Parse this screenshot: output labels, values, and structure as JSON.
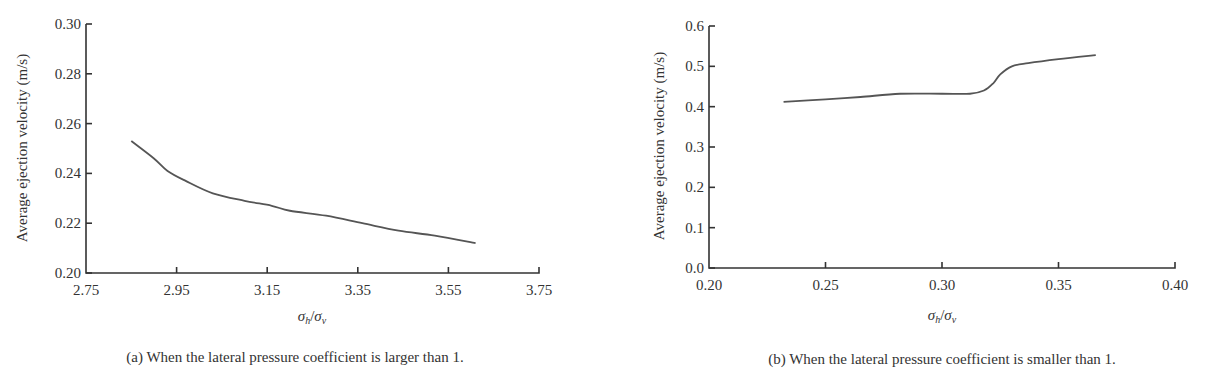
{
  "chart_data": [
    {
      "id": "a",
      "type": "line",
      "title": "",
      "caption": "(a) When the lateral pressure coefficient is larger than 1.",
      "xlabel": "σh/σv",
      "ylabel": "Average ejection velocity (m/s)",
      "xlim": [
        2.75,
        3.75
      ],
      "ylim": [
        0.2,
        0.3
      ],
      "xticks": [
        "2.75",
        "2.95",
        "3.15",
        "3.35",
        "3.55",
        "3.75"
      ],
      "yticks": [
        "0.20",
        "0.22",
        "0.24",
        "0.26",
        "0.28",
        "0.30"
      ],
      "grid": false,
      "legend": null,
      "series": [
        {
          "name": "Average ejection velocity",
          "x": [
            2.85,
            2.9,
            2.93,
            2.97,
            3.03,
            3.1,
            3.16,
            3.2,
            3.28,
            3.36,
            3.44,
            3.52,
            3.61
          ],
          "y": [
            0.253,
            0.246,
            0.241,
            0.237,
            0.232,
            0.229,
            0.227,
            0.225,
            0.223,
            0.22,
            0.217,
            0.215,
            0.212
          ]
        }
      ]
    },
    {
      "id": "b",
      "type": "line",
      "title": "",
      "caption": "(b) When the lateral pressure coefficient is smaller than 1.",
      "xlabel": "σh/σv",
      "ylabel": "Average ejection velocity (m/s)",
      "xlim": [
        0.2,
        0.4
      ],
      "ylim": [
        0.0,
        0.6
      ],
      "xticks": [
        "0.20",
        "0.25",
        "0.30",
        "0.35",
        "0.40"
      ],
      "yticks": [
        "0.0",
        "0.1",
        "0.2",
        "0.3",
        "0.4",
        "0.5",
        "0.6"
      ],
      "grid": false,
      "legend": null,
      "series": [
        {
          "name": "Average ejection velocity",
          "x": [
            0.232,
            0.25,
            0.265,
            0.282,
            0.3,
            0.312,
            0.318,
            0.322,
            0.325,
            0.33,
            0.337,
            0.35,
            0.366
          ],
          "y": [
            0.412,
            0.418,
            0.424,
            0.432,
            0.432,
            0.432,
            0.44,
            0.458,
            0.48,
            0.5,
            0.508,
            0.518,
            0.528
          ]
        }
      ]
    }
  ],
  "panels": {
    "a": {
      "caption": "(a) When the lateral pressure coefficient is larger than 1.",
      "xlabel_main": "σ",
      "xlabel_sub1": "h",
      "xlabel_slash": "/",
      "xlabel_sub2": "v",
      "ylabel": "Average ejection velocity (m/s)"
    },
    "b": {
      "caption": "(b) When the lateral pressure coefficient is smaller than 1.",
      "xlabel_main": "σ",
      "xlabel_sub1": "h",
      "xlabel_slash": "/",
      "xlabel_sub2": "v",
      "ylabel": "Average ejection velocity (m/s)"
    }
  },
  "colors": {
    "axis": "#333333",
    "line": "#555555",
    "background": "#ffffff"
  }
}
